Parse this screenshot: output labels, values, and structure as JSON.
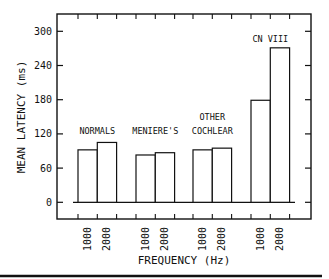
{
  "chart_data": {
    "type": "bar",
    "title": "",
    "xlabel": "FREQUENCY (Hz)",
    "ylabel": "MEAN LATENCY (ms)",
    "ylim": [
      0,
      300
    ],
    "yticks": [
      "0",
      "60",
      "120",
      "180",
      "240",
      "300"
    ],
    "groups": [
      {
        "name": "NORMALS",
        "label_lines": [
          "NORMALS"
        ],
        "categories": [
          "1000",
          "2000"
        ],
        "values": [
          92,
          105
        ]
      },
      {
        "name": "MENIERE'S",
        "label_lines": [
          "MENIERE'S"
        ],
        "categories": [
          "1000",
          "2000"
        ],
        "values": [
          83,
          87
        ]
      },
      {
        "name": "OTHER COCHLEAR",
        "label_lines": [
          "OTHER",
          "COCHLEAR"
        ],
        "categories": [
          "1000",
          "2000"
        ],
        "values": [
          92,
          95
        ]
      },
      {
        "name": "CN VIII",
        "label_lines": [
          "CN VIII"
        ],
        "categories": [
          "1000",
          "2000"
        ],
        "values": [
          179,
          271
        ]
      }
    ],
    "grid": false,
    "legend": "none"
  }
}
